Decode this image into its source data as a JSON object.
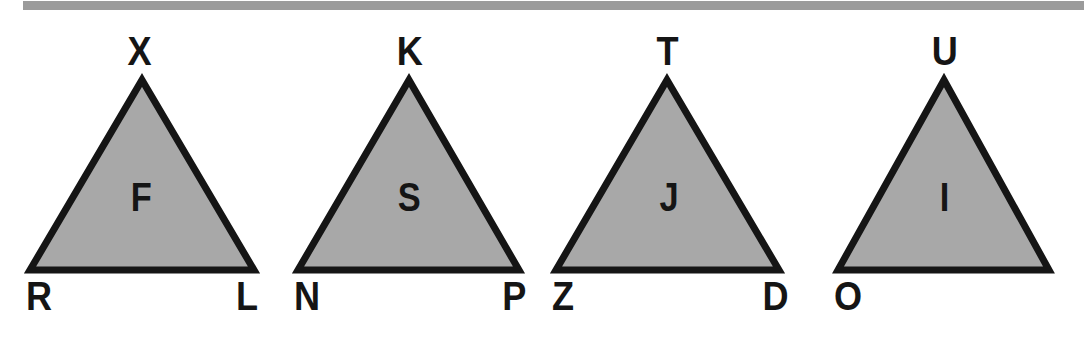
{
  "figure": {
    "width": 1084,
    "height": 344,
    "background_color": "#ffffff",
    "rule_color": "#9b9b9b",
    "triangle_fill_color": "#a8a8a8",
    "triangle_stroke_color": "#151515",
    "label_color": "#151515"
  },
  "triangles": [
    {
      "id": "triangle-1",
      "inner_label": "F",
      "apex_label": "X",
      "bottom_left_label": "R",
      "bottom_right_label": "L",
      "apex_x": 142,
      "apex_y": 78,
      "base_y": 272,
      "left_x": 28,
      "right_x": 256
    },
    {
      "id": "triangle-2",
      "inner_label": "S",
      "apex_label": "K",
      "bottom_left_label": "N",
      "bottom_right_label": "P",
      "apex_x": 409,
      "apex_y": 78,
      "base_y": 272,
      "left_x": 296,
      "right_x": 521
    },
    {
      "id": "triangle-3",
      "inner_label": "J",
      "apex_label": "T",
      "bottom_left_label": "Z",
      "bottom_right_label": "D",
      "apex_x": 667,
      "apex_y": 78,
      "base_y": 272,
      "left_x": 554,
      "right_x": 781
    },
    {
      "id": "triangle-4",
      "inner_label": "I",
      "apex_label": "U",
      "bottom_left_label": "O",
      "bottom_right_label": "",
      "apex_x": 944,
      "apex_y": 78,
      "base_y": 272,
      "left_x": 836,
      "right_x": 1051
    }
  ]
}
